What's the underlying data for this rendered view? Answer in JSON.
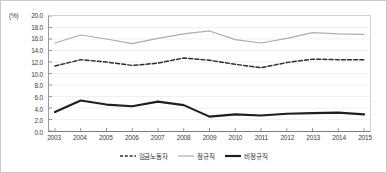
{
  "chart_data": {
    "type": "line",
    "title": "",
    "xlabel": "",
    "ylabel": "",
    "unit_label": "(%)",
    "grid": true,
    "legend_position": "bottom",
    "categories": [
      "2003",
      "2004",
      "2005",
      "2006",
      "2007",
      "2008",
      "2009",
      "2010",
      "2011",
      "2012",
      "2013",
      "2014",
      "2015"
    ],
    "ylim": [
      0.0,
      20.0
    ],
    "ytick_step": 2.0,
    "yticks": [
      "20.0",
      "18.0",
      "16.0",
      "14.0",
      "12.0",
      "10.0",
      "8.0",
      "6.0",
      "4.0",
      "2.0",
      "0.0"
    ],
    "series": [
      {
        "name": "임금노동자",
        "style": "dashed",
        "color": "#2e2e2e",
        "values": [
          11.3,
          12.4,
          12.0,
          11.4,
          11.8,
          12.7,
          12.3,
          11.6,
          11.0,
          11.9,
          12.5,
          12.4,
          12.4
        ]
      },
      {
        "name": "정규직",
        "style": "solid-light",
        "color": "#adadad",
        "values": [
          15.3,
          16.7,
          16.0,
          15.2,
          16.1,
          16.9,
          17.4,
          15.9,
          15.3,
          16.1,
          17.1,
          16.9,
          16.8
        ]
      },
      {
        "name": "비정규직",
        "style": "solid-bold",
        "color": "#1f1f1f",
        "values": [
          3.3,
          5.3,
          4.6,
          4.3,
          5.1,
          4.5,
          2.5,
          2.9,
          2.7,
          3.0,
          3.1,
          3.2,
          2.9
        ]
      }
    ]
  }
}
